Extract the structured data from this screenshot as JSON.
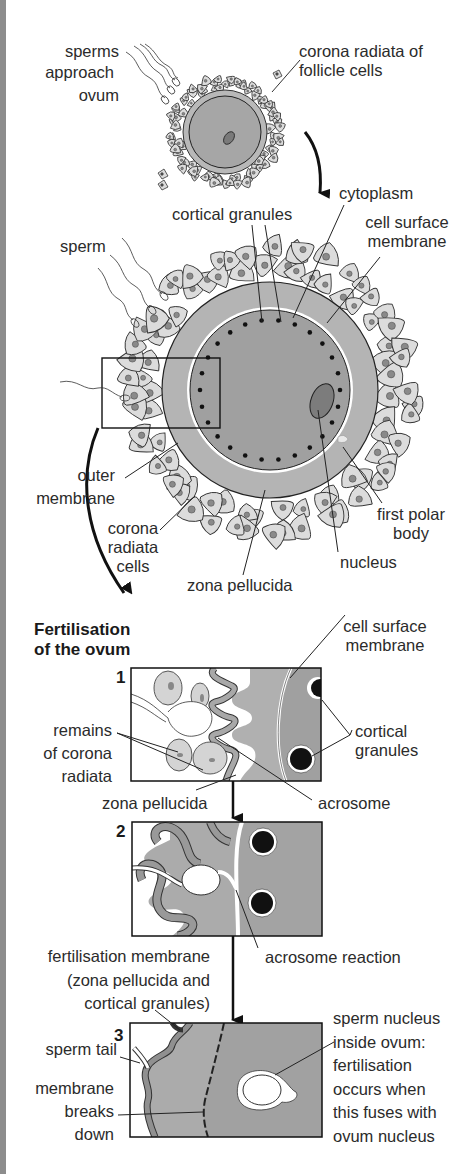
{
  "colors": {
    "cell_fill": "#dcdcdc",
    "zona_fill": "#b4b4b4",
    "cytoplasm_fill": "#a0a0a0",
    "nucleus_fill": "#7c7c7c",
    "outline": "#222222",
    "edge_strip": "#8d8d8d"
  },
  "stage_top": {
    "labels": {
      "sperms": "sperms",
      "approach": "approach",
      "ovum": "ovum",
      "corona_1": "corona radiata of",
      "corona_2": "follicle cells"
    }
  },
  "stage_detail": {
    "labels": {
      "cytoplasm": "cytoplasm",
      "cortical_granules": "cortical granules",
      "cell_surface_1": "cell surface",
      "cell_surface_2": "membrane",
      "sperm": "sperm",
      "outer_1": "outer",
      "outer_2": "membrane",
      "corona_1": "corona",
      "corona_2": "radiata",
      "corona_3": "cells",
      "zona": "zona pellucida",
      "nucleus": "nucleus",
      "polar_1": "first polar",
      "polar_2": "body"
    }
  },
  "fertilisation": {
    "title_1": "Fertilisation",
    "title_2": "of the ovum",
    "step1": {
      "number": "1",
      "cell_surface_1": "cell surface",
      "cell_surface_2": "membrane",
      "remains_1": "remains",
      "remains_2": "of corona",
      "remains_3": "radiata",
      "cortical_1": "cortical",
      "cortical_2": "granules",
      "zona": "zona pellucida",
      "acrosome": "acrosome"
    },
    "step2": {
      "number": "2",
      "acrosome_reaction": "acrosome reaction",
      "fert_membrane_1": "fertilisation membrane",
      "fert_membrane_2": "(zona pellucida and",
      "fert_membrane_3": "cortical granules)"
    },
    "step3": {
      "number": "3",
      "sperm_tail": "sperm tail",
      "membrane_1": "membrane",
      "membrane_2": "breaks",
      "membrane_3": "down",
      "nucleus_1": "sperm nucleus",
      "nucleus_2": "inside ovum:",
      "nucleus_3": "fertilisation",
      "nucleus_4": "occurs when",
      "nucleus_5": "this fuses with",
      "nucleus_6": "ovum nucleus"
    }
  }
}
